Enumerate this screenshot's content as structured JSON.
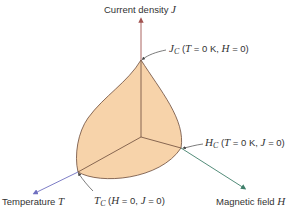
{
  "diagram": {
    "colors": {
      "surface_fill": "#f7d3aa",
      "surface_edge": "#6b4a3a",
      "j_axis": "#a0524f",
      "t_axis": "#6f6fc0",
      "h_axis": "#3f7f6a",
      "leader": "#444444",
      "text": "#333333"
    },
    "axes": {
      "j": {
        "label": "Current density",
        "symbol": "J"
      },
      "t": {
        "label": "Temperature",
        "symbol": "T"
      },
      "h": {
        "label": "Magnetic field",
        "symbol": "H"
      }
    },
    "annotations": {
      "jc": {
        "symbol": "J",
        "subscript": "C",
        "condition_open": "(",
        "c1_var": "T",
        "c1_val": " = 0 K, ",
        "c2_var": "H",
        "c2_val": " = 0)"
      },
      "hc": {
        "symbol": "H",
        "subscript": "C",
        "condition_open": "(",
        "c1_var": "T",
        "c1_val": " = 0 K, ",
        "c2_var": "J",
        "c2_val": " = 0)"
      },
      "tc": {
        "symbol": "T",
        "subscript": "C",
        "condition_open": "(",
        "c1_var": "H",
        "c1_val": " = 0, ",
        "c2_var": "J",
        "c2_val": " = 0)"
      }
    }
  }
}
